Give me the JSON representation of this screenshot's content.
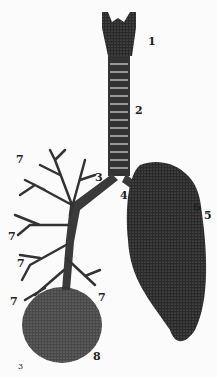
{
  "figure": {
    "labels": [
      {
        "id": "larynx",
        "text": "1",
        "x": 148,
        "y": 36
      },
      {
        "id": "trachea",
        "text": "2",
        "x": 135,
        "y": 105
      },
      {
        "id": "right-bronchus",
        "text": "3",
        "x": 95,
        "y": 172
      },
      {
        "id": "left-bronchus",
        "text": "4",
        "x": 120,
        "y": 190
      },
      {
        "id": "lung-6",
        "text": "6",
        "x": 193,
        "y": 202
      },
      {
        "id": "lung-5",
        "text": "5",
        "x": 204,
        "y": 210
      },
      {
        "id": "branch-7a",
        "text": "7",
        "x": 16,
        "y": 154
      },
      {
        "id": "branch-7b",
        "text": "7",
        "x": 8,
        "y": 231
      },
      {
        "id": "branch-7c",
        "text": "7",
        "x": 17,
        "y": 258
      },
      {
        "id": "branch-7d",
        "text": "7",
        "x": 10,
        "y": 296
      },
      {
        "id": "branch-7e",
        "text": "7",
        "x": 98,
        "y": 292
      },
      {
        "id": "alveoli",
        "text": "8",
        "x": 93,
        "y": 351
      },
      {
        "id": "small-3",
        "text": "3",
        "x": 18,
        "y": 363
      }
    ]
  }
}
